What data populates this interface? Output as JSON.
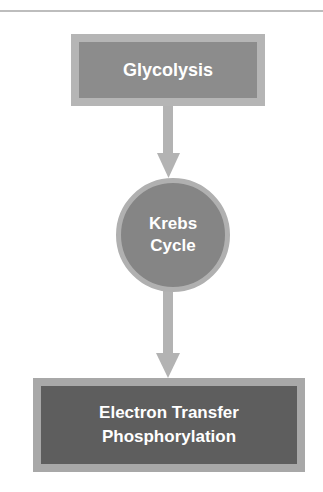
{
  "diagram": {
    "type": "flowchart",
    "direction": "top-to-bottom",
    "nodes": [
      {
        "id": "glycolysis",
        "shape": "rectangle",
        "label_lines": [
          "Glycolysis"
        ],
        "fill": "#8c8c8c",
        "border": "#b5b5b5"
      },
      {
        "id": "krebs",
        "shape": "circle",
        "label_lines": [
          "Krebs",
          "Cycle"
        ],
        "fill": "#858585",
        "border": "#b0b0b0"
      },
      {
        "id": "etp",
        "shape": "rectangle",
        "label_lines": [
          "Electron Transfer",
          "Phosphorylation"
        ],
        "fill": "#5e5e5e",
        "border": "#a8a8a8"
      }
    ],
    "edges": [
      {
        "from": "glycolysis",
        "to": "krebs",
        "icon": "down-arrow-icon",
        "color": "#b3b3b3"
      },
      {
        "from": "krebs",
        "to": "etp",
        "icon": "down-arrow-icon",
        "color": "#b3b3b3"
      }
    ]
  }
}
